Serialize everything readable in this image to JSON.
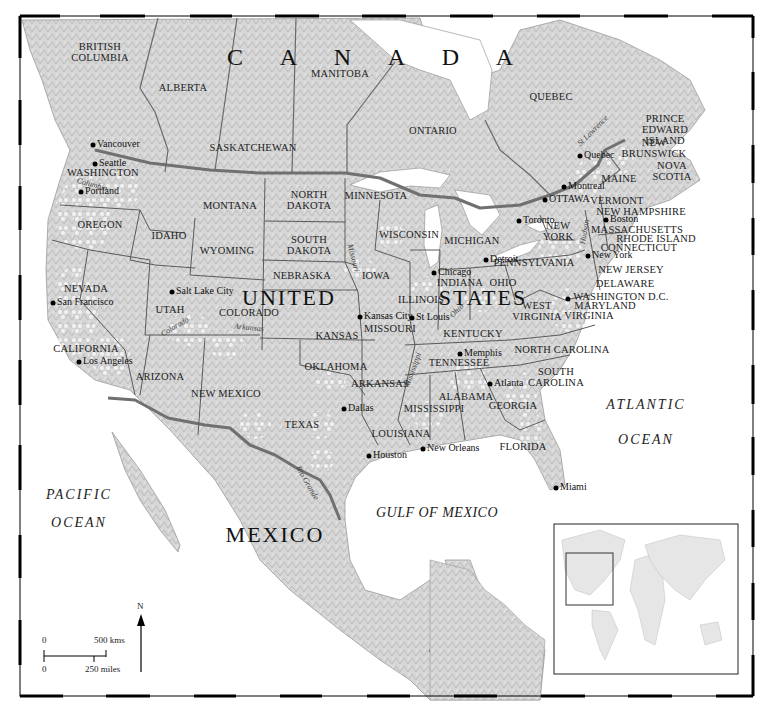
{
  "map": {
    "countries": [
      {
        "id": "canada",
        "label": "C A N A D A",
        "x": 378,
        "y": 57
      },
      {
        "id": "united",
        "label": "UNITED",
        "x": 289,
        "y": 298
      },
      {
        "id": "states",
        "label": "STATES",
        "x": 483,
        "y": 298
      },
      {
        "id": "mexico",
        "label": "MEXICO",
        "x": 275,
        "y": 535
      }
    ],
    "provinces": [
      {
        "id": "british-columbia",
        "label": "BRITISH\nCOLUMBIA",
        "x": 100,
        "y": 52
      },
      {
        "id": "alberta",
        "label": "ALBERTA",
        "x": 183,
        "y": 88
      },
      {
        "id": "manitoba",
        "label": "MANITOBA",
        "x": 340,
        "y": 74
      },
      {
        "id": "saskatchewan",
        "label": "SASKATCHEWAN",
        "x": 253,
        "y": 148
      },
      {
        "id": "ontario",
        "label": "ONTARIO",
        "x": 433,
        "y": 131
      },
      {
        "id": "quebec",
        "label": "QUEBEC",
        "x": 551,
        "y": 97
      },
      {
        "id": "new-brunswick",
        "label": "NEW\nBRUNSWICK",
        "x": 654,
        "y": 148
      },
      {
        "id": "prince-edward-island",
        "label": "PRINCE\nEDWARD\nISLAND",
        "x": 665,
        "y": 130
      },
      {
        "id": "nova-scotia",
        "label": "NOVA\nSCOTIA",
        "x": 672,
        "y": 171
      }
    ],
    "states": [
      {
        "id": "washington",
        "label": "WASHINGTON",
        "x": 103,
        "y": 173
      },
      {
        "id": "oregon",
        "label": "OREGON",
        "x": 100,
        "y": 225
      },
      {
        "id": "idaho",
        "label": "IDAHO",
        "x": 169,
        "y": 236
      },
      {
        "id": "montana",
        "label": "MONTANA",
        "x": 230,
        "y": 206
      },
      {
        "id": "wyoming",
        "label": "WYOMING",
        "x": 227,
        "y": 251
      },
      {
        "id": "north-dakota",
        "label": "NORTH\nDAKOTA",
        "x": 309,
        "y": 200
      },
      {
        "id": "south-dakota",
        "label": "SOUTH\nDAKOTA",
        "x": 309,
        "y": 245
      },
      {
        "id": "nebraska",
        "label": "NEBRASKA",
        "x": 302,
        "y": 276
      },
      {
        "id": "minnesota",
        "label": "MINNESOTA",
        "x": 376,
        "y": 196
      },
      {
        "id": "wisconsin",
        "label": "WISCONSIN",
        "x": 409,
        "y": 235
      },
      {
        "id": "michigan",
        "label": "MICHIGAN",
        "x": 472,
        "y": 241
      },
      {
        "id": "iowa",
        "label": "IOWA",
        "x": 376,
        "y": 276
      },
      {
        "id": "illinois",
        "label": "ILLINOIS",
        "x": 421,
        "y": 300
      },
      {
        "id": "indiana",
        "label": "INDIANA",
        "x": 460,
        "y": 283
      },
      {
        "id": "ohio",
        "label": "OHIO",
        "x": 503,
        "y": 283
      },
      {
        "id": "nevada",
        "label": "NEVADA",
        "x": 86,
        "y": 289
      },
      {
        "id": "utah",
        "label": "UTAH",
        "x": 170,
        "y": 310
      },
      {
        "id": "colorado",
        "label": "COLORADO",
        "x": 249,
        "y": 313
      },
      {
        "id": "kansas",
        "label": "KANSAS",
        "x": 337,
        "y": 336
      },
      {
        "id": "missouri",
        "label": "MISSOURI",
        "x": 390,
        "y": 329
      },
      {
        "id": "kentucky",
        "label": "KENTUCKY",
        "x": 473,
        "y": 334
      },
      {
        "id": "west-virginia",
        "label": "WEST\nVIRGINIA",
        "x": 537,
        "y": 311
      },
      {
        "id": "virginia",
        "label": "VIRGINIA",
        "x": 589,
        "y": 316
      },
      {
        "id": "california",
        "label": "CALIFORNIA",
        "x": 86,
        "y": 349
      },
      {
        "id": "arizona",
        "label": "ARIZONA",
        "x": 160,
        "y": 377
      },
      {
        "id": "new-mexico",
        "label": "NEW MEXICO",
        "x": 226,
        "y": 394
      },
      {
        "id": "oklahoma",
        "label": "OKLAHOMA",
        "x": 336,
        "y": 367
      },
      {
        "id": "arkansas",
        "label": "ARKANSAS",
        "x": 380,
        "y": 384
      },
      {
        "id": "tennessee",
        "label": "TENNESSEE",
        "x": 459,
        "y": 363
      },
      {
        "id": "north-carolina",
        "label": "NORTH CAROLINA",
        "x": 562,
        "y": 350
      },
      {
        "id": "south-carolina",
        "label": "SOUTH\nCAROLINA",
        "x": 556,
        "y": 377
      },
      {
        "id": "alabama",
        "label": "ALABAMA",
        "x": 466,
        "y": 397
      },
      {
        "id": "georgia",
        "label": "GEORGIA",
        "x": 513,
        "y": 406
      },
      {
        "id": "mississippi",
        "label": "MISSISSIPPI",
        "x": 434,
        "y": 409
      },
      {
        "id": "texas",
        "label": "TEXAS",
        "x": 302,
        "y": 425
      },
      {
        "id": "louisiana",
        "label": "LOUISIANA",
        "x": 401,
        "y": 434
      },
      {
        "id": "florida",
        "label": "FLORIDA",
        "x": 523,
        "y": 447
      },
      {
        "id": "new-york",
        "label": "NEW\nYORK",
        "x": 558,
        "y": 231
      },
      {
        "id": "pennsylvania",
        "label": "PENNSYLVANIA",
        "x": 534,
        "y": 263
      },
      {
        "id": "maine",
        "label": "MAINE",
        "x": 619,
        "y": 179
      },
      {
        "id": "vermont",
        "label": "VERMONT",
        "x": 617,
        "y": 201
      },
      {
        "id": "new-hampshire",
        "label": "NEW HAMPSHIRE",
        "x": 641,
        "y": 212
      },
      {
        "id": "massachusetts",
        "label": "MASSACHUSETTS",
        "x": 637,
        "y": 230
      },
      {
        "id": "rhode-island",
        "label": "RHODE ISLAND",
        "x": 656,
        "y": 239
      },
      {
        "id": "connecticut",
        "label": "CONNECTICUT",
        "x": 639,
        "y": 248
      },
      {
        "id": "new-jersey",
        "label": "NEW JERSEY",
        "x": 631,
        "y": 270
      },
      {
        "id": "delaware",
        "label": "DELAWARE",
        "x": 625,
        "y": 284
      },
      {
        "id": "washington-dc",
        "label": "WASHINGTON D.C.",
        "x": 621,
        "y": 297
      },
      {
        "id": "maryland",
        "label": "MARYLAND",
        "x": 605,
        "y": 306
      }
    ],
    "cities": [
      {
        "id": "vancouver",
        "label": "Vancouver",
        "x": 93,
        "y": 145
      },
      {
        "id": "seattle",
        "label": "Seattle",
        "x": 95,
        "y": 164
      },
      {
        "id": "portland",
        "label": "Portland",
        "x": 81,
        "y": 192
      },
      {
        "id": "san-francisco",
        "label": "San Francisco",
        "x": 53,
        "y": 303
      },
      {
        "id": "los-angeles",
        "label": "Los Angeles",
        "x": 79,
        "y": 362
      },
      {
        "id": "salt-lake-city",
        "label": "Salt Lake City",
        "x": 172,
        "y": 292
      },
      {
        "id": "kansas-city",
        "label": "Kansas City",
        "x": 360,
        "y": 317
      },
      {
        "id": "st-louis",
        "label": "St Louis",
        "x": 412,
        "y": 318
      },
      {
        "id": "chicago",
        "label": "Chicago",
        "x": 434,
        "y": 273
      },
      {
        "id": "detroit",
        "label": "Detroit",
        "x": 486,
        "y": 260
      },
      {
        "id": "toronto",
        "label": "Toronto",
        "x": 519,
        "y": 221
      },
      {
        "id": "ottawa",
        "label": "OTTAWA",
        "x": 545,
        "y": 200
      },
      {
        "id": "montreal",
        "label": "Montreal",
        "x": 564,
        "y": 187
      },
      {
        "id": "quebec-city",
        "label": "Quebec",
        "x": 580,
        "y": 156
      },
      {
        "id": "boston",
        "label": "Boston",
        "x": 606,
        "y": 220
      },
      {
        "id": "new-york-city",
        "label": "New York",
        "x": 588,
        "y": 256
      },
      {
        "id": "washington-dc-city",
        "label": "",
        "x": 568,
        "y": 299
      },
      {
        "id": "memphis",
        "label": "Memphis",
        "x": 460,
        "y": 354
      },
      {
        "id": "atlanta",
        "label": "Atlanta",
        "x": 490,
        "y": 384
      },
      {
        "id": "dallas",
        "label": "Dallas",
        "x": 344,
        "y": 409
      },
      {
        "id": "houston",
        "label": "Houston",
        "x": 369,
        "y": 456
      },
      {
        "id": "new-orleans",
        "label": "New Orleans",
        "x": 423,
        "y": 449
      },
      {
        "id": "miami",
        "label": "Miami",
        "x": 556,
        "y": 488
      }
    ],
    "oceans": [
      {
        "id": "pacific",
        "label": "PACIFIC",
        "x": 79,
        "y": 495
      },
      {
        "id": "pacific-2",
        "label": "OCEAN",
        "x": 79,
        "y": 523
      },
      {
        "id": "atlantic",
        "label": "ATLANTIC",
        "x": 646,
        "y": 405
      },
      {
        "id": "atlantic-2",
        "label": "OCEAN",
        "x": 646,
        "y": 440
      },
      {
        "id": "gulf",
        "label": "GULF OF MEXICO",
        "x": 437,
        "y": 513
      }
    ],
    "rivers": [
      {
        "id": "columbia",
        "label": "Columbia",
        "x": 92,
        "y": 185,
        "rot": 15
      },
      {
        "id": "colorado-river",
        "label": "Colorado",
        "x": 175,
        "y": 327,
        "rot": -30
      },
      {
        "id": "arkansas-river",
        "label": "Arkansas",
        "x": 249,
        "y": 328,
        "rot": 5
      },
      {
        "id": "missouri-river",
        "label": "Missouri",
        "x": 353,
        "y": 258,
        "rot": 75
      },
      {
        "id": "ohio-river",
        "label": "Ohio",
        "x": 457,
        "y": 311,
        "rot": -45
      },
      {
        "id": "mississippi-river",
        "label": "Mississippi",
        "x": 413,
        "y": 370,
        "rot": -70
      },
      {
        "id": "rio-grande",
        "label": "Rio Grande",
        "x": 307,
        "y": 483,
        "rot": 60
      },
      {
        "id": "hudson",
        "label": "Hudson",
        "x": 585,
        "y": 232,
        "rot": -80
      },
      {
        "id": "st-lawrence",
        "label": "St Lawrence",
        "x": 593,
        "y": 131,
        "rot": -45
      }
    ],
    "scale_bar": {
      "km_start": "0",
      "km_end": "500 kms",
      "mi_start": "0",
      "mi_end": "250 miles"
    },
    "north_arrow": {
      "label": "N"
    },
    "inset": {
      "label": "World locator map"
    },
    "colors": {
      "land": "#d9d9d9",
      "land_relief": "#c4c4c4",
      "water": "#ffffff",
      "border_intl": "#707070",
      "border_state": "#5a5a5a",
      "frame": "#000000",
      "wine_region": "#f2f2f2"
    }
  }
}
